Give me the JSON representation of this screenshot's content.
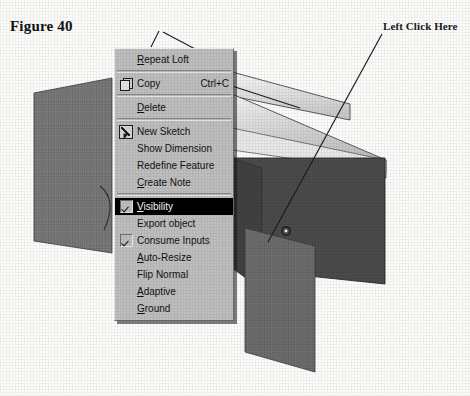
{
  "figure": {
    "caption": "Figure 40"
  },
  "annotation": {
    "label": "Left Click Here"
  },
  "viewport": {
    "name": "cad-3d-viewport",
    "description": "Lofted solid with two sketch planes",
    "vertex_marker": "circle-marker",
    "colors": {
      "background": "#ffffff",
      "plane_fill": "#787878",
      "solid_dark_face": "#4a4a4a",
      "solid_light_face": "#dcdcdc",
      "outline": "#2b2b2b"
    }
  },
  "context_menu": {
    "name": "feature-context-menu",
    "background": "#bfbfbf",
    "highlight_color": "#000000",
    "highlight_text_color": "#ffffff",
    "items": [
      {
        "id": "repeat-loft",
        "label": "Repeat Loft",
        "mnemonic": "R",
        "icon": null,
        "check": null,
        "accel": "",
        "selected": false,
        "sep_after": true
      },
      {
        "id": "copy",
        "label": "Copy",
        "mnemonic": "",
        "icon": "copy-icon",
        "check": null,
        "accel": "Ctrl+C",
        "selected": false,
        "sep_after": true
      },
      {
        "id": "delete",
        "label": "Delete",
        "mnemonic": "D",
        "icon": null,
        "check": null,
        "accel": "",
        "selected": false,
        "sep_after": true
      },
      {
        "id": "new-sketch",
        "label": "New Sketch",
        "mnemonic": "",
        "icon": "sketch-icon",
        "check": null,
        "accel": "",
        "selected": false,
        "sep_after": false
      },
      {
        "id": "show-dimension",
        "label": "Show Dimension",
        "mnemonic": "",
        "icon": null,
        "check": null,
        "accel": "",
        "selected": false,
        "sep_after": false
      },
      {
        "id": "redefine-feature",
        "label": "Redefine Feature",
        "mnemonic": "",
        "icon": null,
        "check": null,
        "accel": "",
        "selected": false,
        "sep_after": false
      },
      {
        "id": "create-note",
        "label": "Create Note",
        "mnemonic": "C",
        "icon": null,
        "check": null,
        "accel": "",
        "selected": false,
        "sep_after": true
      },
      {
        "id": "visibility",
        "label": "Visibility",
        "mnemonic": "V",
        "icon": null,
        "check": true,
        "accel": "",
        "selected": true,
        "sep_after": false
      },
      {
        "id": "export-object",
        "label": "Export object",
        "mnemonic": "",
        "icon": null,
        "check": false,
        "accel": "",
        "selected": false,
        "sep_after": false
      },
      {
        "id": "consume-inputs",
        "label": "Consume Inputs",
        "mnemonic": "",
        "icon": null,
        "check": true,
        "accel": "",
        "selected": false,
        "sep_after": false
      },
      {
        "id": "auto-resize",
        "label": "Auto-Resize",
        "mnemonic": "A",
        "icon": null,
        "check": false,
        "accel": "",
        "selected": false,
        "sep_after": false
      },
      {
        "id": "flip-normal",
        "label": "Flip Normal",
        "mnemonic": "",
        "icon": null,
        "check": false,
        "accel": "",
        "selected": false,
        "sep_after": false
      },
      {
        "id": "adaptive",
        "label": "Adaptive",
        "mnemonic": "A",
        "icon": null,
        "check": false,
        "accel": "",
        "selected": false,
        "sep_after": false
      },
      {
        "id": "ground",
        "label": "Ground",
        "mnemonic": "G",
        "icon": null,
        "check": false,
        "accel": "",
        "selected": false,
        "sep_after": false
      }
    ]
  }
}
